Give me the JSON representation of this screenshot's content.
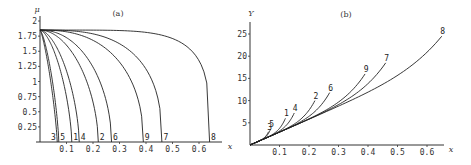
{
  "chart_data": [
    {
      "type": "line",
      "title": "(a)",
      "xlabel": "x",
      "ylabel": "μ",
      "xlim": [
        0,
        0.68
      ],
      "ylim": [
        0,
        2
      ],
      "x_ticks": [
        "0.1",
        "0.2",
        "0.3",
        "0.4",
        "0.5",
        "0.6"
      ],
      "x_tick_values": [
        0.1,
        0.2,
        0.3,
        0.4,
        0.5,
        0.6
      ],
      "y_ticks": [
        "0.25",
        "0.5",
        "0.75",
        "1",
        "1.25",
        "1.5",
        "1.75",
        "2"
      ],
      "y_tick_values": [
        0.25,
        0.5,
        0.75,
        1,
        1.25,
        1.5,
        1.75,
        2
      ],
      "grid": false,
      "series": [
        {
          "name": "3",
          "mu0": 1.85,
          "x_end": 0.065,
          "shape": 1.3
        },
        {
          "name": "5",
          "mu0": 1.85,
          "x_end": 0.071,
          "shape": 1.4
        },
        {
          "name": "1",
          "mu0": 1.85,
          "x_end": 0.12,
          "shape": 1.6
        },
        {
          "name": "4",
          "mu0": 1.85,
          "x_end": 0.148,
          "shape": 1.7
        },
        {
          "name": "2",
          "mu0": 1.85,
          "x_end": 0.22,
          "shape": 1.9
        },
        {
          "name": "6",
          "mu0": 1.85,
          "x_end": 0.27,
          "shape": 2.1
        },
        {
          "name": "9",
          "mu0": 1.85,
          "x_end": 0.39,
          "shape": 2.5
        },
        {
          "name": "7",
          "mu0": 1.85,
          "x_end": 0.46,
          "shape": 3.0
        },
        {
          "name": "8",
          "mu0": 1.85,
          "x_end": 0.64,
          "shape": 5.5
        }
      ]
    },
    {
      "type": "line",
      "title": "(b)",
      "xlabel": "x",
      "ylabel": "Y",
      "xlim": [
        0,
        0.68
      ],
      "ylim": [
        0,
        27
      ],
      "x_ticks": [
        "0.1",
        "0.2",
        "0.3",
        "0.4",
        "0.5",
        "0.6"
      ],
      "x_tick_values": [
        0.1,
        0.2,
        0.3,
        0.4,
        0.5,
        0.6
      ],
      "y_ticks": [
        "5",
        "10",
        "15",
        "20",
        "25"
      ],
      "y_tick_values": [
        5,
        10,
        15,
        20,
        25
      ],
      "grid": false,
      "series": [
        {
          "name": "3",
          "x_end": 0.063,
          "y_end": 3.0
        },
        {
          "name": "5",
          "x_end": 0.07,
          "y_end": 3.6
        },
        {
          "name": "1",
          "x_end": 0.12,
          "y_end": 6.0
        },
        {
          "name": "4",
          "x_end": 0.15,
          "y_end": 7.2
        },
        {
          "name": "2",
          "x_end": 0.22,
          "y_end": 10.0
        },
        {
          "name": "6",
          "x_end": 0.27,
          "y_end": 11.8
        },
        {
          "name": "9",
          "x_end": 0.39,
          "y_end": 16.0
        },
        {
          "name": "7",
          "x_end": 0.46,
          "y_end": 18.5
        },
        {
          "name": "8",
          "x_end": 0.65,
          "y_end": 24.5
        }
      ]
    }
  ]
}
